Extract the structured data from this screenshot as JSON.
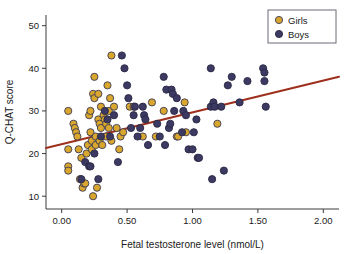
{
  "chart_data": {
    "type": "scatter",
    "title": "",
    "xlabel": "Fetal testosterone level (nmol/L)",
    "ylabel": "Q-CHAT score",
    "xlim": [
      -0.12,
      2.12
    ],
    "ylim": [
      7.0,
      52.5
    ],
    "xticks": [
      0.0,
      0.5,
      1.0,
      1.5,
      2.0
    ],
    "xticklabels": [
      "0.00",
      "0.50",
      "1.00",
      "1.50",
      "2.00"
    ],
    "yticks": [
      10,
      20,
      30,
      40,
      50
    ],
    "yticklabels": [
      "10",
      "20",
      "30",
      "40",
      "50"
    ],
    "grid": false,
    "legend_position": "top-right",
    "legend_entries": [
      {
        "name": "Girls",
        "color": "#d9a62e",
        "edge": "#3a3a55"
      },
      {
        "name": "Boys",
        "color": "#3c3a63",
        "edge": "#2a2843"
      }
    ],
    "series": [
      {
        "name": "Girls",
        "color": "#d9a62e",
        "edge": "#3a3a55",
        "points": [
          [
            0.05,
            30
          ],
          [
            0.05,
            21
          ],
          [
            0.05,
            17
          ],
          [
            0.05,
            16
          ],
          [
            0.09,
            27
          ],
          [
            0.1,
            26
          ],
          [
            0.11,
            25
          ],
          [
            0.12,
            24
          ],
          [
            0.13,
            21
          ],
          [
            0.14,
            14
          ],
          [
            0.15,
            19
          ],
          [
            0.16,
            12
          ],
          [
            0.17,
            13
          ],
          [
            0.18,
            13
          ],
          [
            0.19,
            20
          ],
          [
            0.2,
            22
          ],
          [
            0.21,
            29
          ],
          [
            0.22,
            30
          ],
          [
            0.22,
            25
          ],
          [
            0.23,
            23
          ],
          [
            0.23,
            21
          ],
          [
            0.24,
            10
          ],
          [
            0.24,
            34
          ],
          [
            0.25,
            38
          ],
          [
            0.25,
            33
          ],
          [
            0.26,
            24
          ],
          [
            0.26,
            22
          ],
          [
            0.27,
            12
          ],
          [
            0.28,
            34
          ],
          [
            0.28,
            28
          ],
          [
            0.29,
            27
          ],
          [
            0.29,
            23
          ],
          [
            0.3,
            31
          ],
          [
            0.3,
            26
          ],
          [
            0.31,
            22
          ],
          [
            0.32,
            29
          ],
          [
            0.33,
            28
          ],
          [
            0.34,
            27
          ],
          [
            0.34,
            24
          ],
          [
            0.35,
            36
          ],
          [
            0.36,
            30
          ],
          [
            0.36,
            26
          ],
          [
            0.37,
            33
          ],
          [
            0.38,
            43
          ],
          [
            0.38,
            23
          ],
          [
            0.4,
            31
          ],
          [
            0.42,
            26
          ],
          [
            0.44,
            21
          ],
          [
            0.45,
            24
          ],
          [
            0.47,
            25
          ],
          [
            0.52,
            31
          ],
          [
            0.55,
            31
          ],
          [
            0.62,
            24
          ],
          [
            0.69,
            32
          ],
          [
            0.72,
            24
          ],
          [
            0.78,
            30
          ],
          [
            0.88,
            24
          ],
          [
            0.89,
            24
          ],
          [
            0.94,
            32
          ],
          [
            0.95,
            25
          ],
          [
            1.19,
            27
          ]
        ]
      },
      {
        "name": "Boys",
        "color": "#3c3a63",
        "edge": "#2a2843",
        "points": [
          [
            0.15,
            14
          ],
          [
            0.18,
            18
          ],
          [
            0.21,
            17
          ],
          [
            0.22,
            17
          ],
          [
            0.25,
            20
          ],
          [
            0.28,
            14
          ],
          [
            0.3,
            24
          ],
          [
            0.33,
            30
          ],
          [
            0.35,
            28
          ],
          [
            0.37,
            24
          ],
          [
            0.4,
            29
          ],
          [
            0.43,
            18
          ],
          [
            0.46,
            43
          ],
          [
            0.48,
            40
          ],
          [
            0.5,
            36
          ],
          [
            0.51,
            33
          ],
          [
            0.53,
            26
          ],
          [
            0.55,
            29
          ],
          [
            0.56,
            31
          ],
          [
            0.58,
            24
          ],
          [
            0.6,
            26
          ],
          [
            0.62,
            31
          ],
          [
            0.63,
            29
          ],
          [
            0.64,
            28
          ],
          [
            0.66,
            22
          ],
          [
            0.73,
            27
          ],
          [
            0.75,
            24
          ],
          [
            0.78,
            38
          ],
          [
            0.79,
            22
          ],
          [
            0.8,
            35
          ],
          [
            0.82,
            26
          ],
          [
            0.83,
            27
          ],
          [
            0.84,
            35
          ],
          [
            0.85,
            34
          ],
          [
            0.86,
            30
          ],
          [
            0.88,
            33
          ],
          [
            0.92,
            25
          ],
          [
            0.93,
            30
          ],
          [
            0.95,
            29
          ],
          [
            0.97,
            21
          ],
          [
            1.0,
            21
          ],
          [
            1.01,
            25
          ],
          [
            1.03,
            28
          ],
          [
            1.04,
            19
          ],
          [
            1.05,
            19
          ],
          [
            1.14,
            40
          ],
          [
            1.14,
            31
          ],
          [
            1.15,
            14
          ],
          [
            1.16,
            32
          ],
          [
            1.17,
            31
          ],
          [
            1.22,
            31
          ],
          [
            1.24,
            16
          ],
          [
            1.27,
            36
          ],
          [
            1.3,
            38
          ],
          [
            1.36,
            32
          ],
          [
            1.42,
            37
          ],
          [
            1.54,
            40
          ],
          [
            1.55,
            39
          ],
          [
            1.55,
            37
          ],
          [
            1.56,
            31
          ]
        ]
      }
    ],
    "trendline": {
      "name": "regression-line",
      "color": "#9e2f1c",
      "x_start": -0.12,
      "y_start": 21.3,
      "x_end": 2.12,
      "y_end": 38.0
    }
  }
}
